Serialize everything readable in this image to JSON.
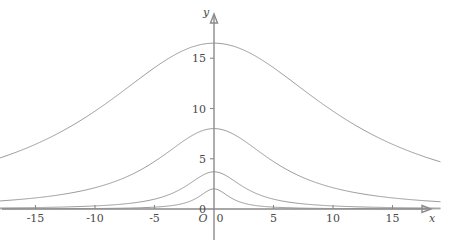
{
  "chart_data": {
    "type": "line",
    "title": "",
    "subtitle": "",
    "xlabel": "x",
    "ylabel": "y",
    "origin_label": "O",
    "grid": false,
    "legend": null,
    "xlim": [
      -18.5,
      19.0
    ],
    "ylim": [
      -1.5,
      17.5
    ],
    "x_ticks": [
      -15,
      -10,
      -5,
      5,
      10,
      15
    ],
    "x_tick_labels": [
      "-15",
      "-10",
      "-5",
      "5",
      "10",
      "15"
    ],
    "x_zero_label": "0",
    "y_ticks": [
      0,
      5,
      10,
      15
    ],
    "y_tick_labels": [
      "0",
      "5",
      "10",
      "15"
    ],
    "series": [
      {
        "name": "curve-1-widest-tallest",
        "shape": "lorentzian",
        "peak_value": 16.5,
        "center": 0,
        "half_width": 12.0,
        "color": "#8e8e8e",
        "values_at": {
          "-18": 7.2,
          "-15": 8.7,
          "-10": 11.8,
          "-5": 14.9,
          "0": 16.5,
          "5": 14.9,
          "10": 11.8,
          "15": 8.7,
          "18": 7.2
        }
      },
      {
        "name": "curve-2-medium",
        "shape": "lorentzian",
        "peak_value": 8.0,
        "center": 0,
        "half_width": 6.0,
        "color": "#8e8e8e",
        "values_at": {
          "-18": 0.8,
          "-15": 1.2,
          "-10": 2.3,
          "-5": 4.9,
          "0": 8.0,
          "5": 4.9,
          "10": 2.3,
          "15": 1.2,
          "18": 0.8
        }
      },
      {
        "name": "curve-3-narrow",
        "shape": "lorentzian",
        "peak_value": 3.7,
        "center": 0,
        "half_width": 3.0,
        "color": "#8e8e8e",
        "values_at": {
          "-18": 0.1,
          "-15": 0.15,
          "-10": 0.32,
          "-5": 1.0,
          "0": 3.7,
          "5": 1.0,
          "10": 0.32,
          "15": 0.15,
          "18": 0.1
        }
      },
      {
        "name": "curve-4-narrowest-shortest",
        "shape": "lorentzian",
        "peak_value": 2.0,
        "center": 0,
        "half_width": 1.6,
        "color": "#8e8e8e",
        "values_at": {
          "-18": 0.02,
          "-15": 0.02,
          "-10": 0.05,
          "-5": 0.19,
          "0": 2.0,
          "5": 0.19,
          "10": 0.05,
          "15": 0.02,
          "18": 0.02
        }
      }
    ]
  },
  "axes": {
    "x_axis_name": "x",
    "y_axis_name": "y",
    "origin": "O",
    "axis_color": "#8a8a8a"
  }
}
